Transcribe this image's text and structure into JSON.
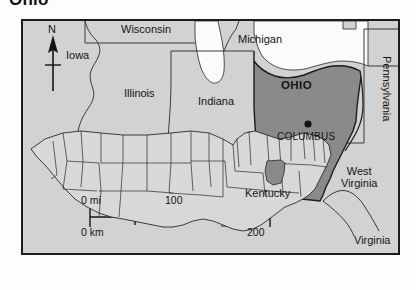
{
  "title": "Ohio",
  "map": {
    "frame": {
      "x": 21,
      "y": 19,
      "width": 379,
      "height": 236
    },
    "compass": {
      "letter": "N",
      "icon": "north-arrow-icon"
    },
    "highlight_state": "OHIO",
    "capital": {
      "name": "COLUMBUS",
      "marker": "capital-dot-icon"
    },
    "labels": [
      {
        "name": "wisconsin",
        "text": "Wisconsin",
        "x": 98,
        "y": 4
      },
      {
        "name": "michigan",
        "text": "Michigan",
        "x": 215,
        "y": 14
      },
      {
        "name": "iowa",
        "text": "Iowa",
        "x": 43,
        "y": 30
      },
      {
        "name": "illinois",
        "text": "Illinois",
        "x": 101,
        "y": 67
      },
      {
        "name": "indiana",
        "text": "Indiana",
        "x": 175,
        "y": 75
      },
      {
        "name": "kentucky",
        "text": "Kentucky",
        "x": 222,
        "y": 167
      },
      {
        "name": "virginia",
        "text": "Virginia",
        "x": 330,
        "y": 214
      }
    ],
    "multiline_labels": [
      {
        "name": "west-virginia",
        "line1": "West",
        "line2": "Virginia",
        "x": 320,
        "y": 147
      }
    ],
    "vertical_labels": [
      {
        "name": "pennsylvania",
        "text": "Pennsylvania",
        "x": 366,
        "y": 35
      }
    ],
    "ohio_label_pos": {
      "x": 277,
      "y": 65
    },
    "capital_dot_pos": {
      "x": 286,
      "y": 105
    },
    "capital_label_pos": {
      "x": 259,
      "y": 113
    }
  },
  "scale_bar": {
    "name": "distance-scale",
    "miles_start": "0 mi",
    "miles_end": "100",
    "km_start": "0 km",
    "km_end": "200"
  },
  "inset": {
    "name": "us-locator-inset",
    "description": "United States locator map with Ohio highlighted"
  },
  "colors": {
    "land": "#d2d2d2",
    "highlight": "#8a8a8a",
    "water": "#fbfbfb",
    "border": "#1c1c1c",
    "state_line": "#3a3a3a",
    "text": "#141414"
  }
}
